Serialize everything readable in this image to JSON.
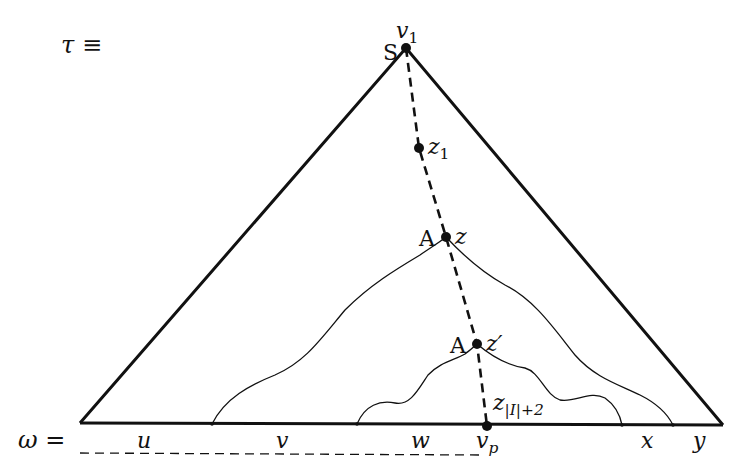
{
  "figure": {
    "tree_label": "τ ≡",
    "word_label": "ω =",
    "colors": {
      "stroke": "#111111",
      "background": "#ffffff"
    }
  },
  "nodes": {
    "v1": {
      "label": "v",
      "sub": "1",
      "mark": "S"
    },
    "z1": {
      "label": "z",
      "sub": "1"
    },
    "z": {
      "label": "z",
      "mark": "A"
    },
    "zprime": {
      "label": "z′",
      "mark": "A"
    },
    "z_last": {
      "label": "z",
      "sub": "|I|+2"
    },
    "vp": {
      "label": "v",
      "sub": "p"
    }
  },
  "segments": {
    "u": "u",
    "v": "v",
    "w": "w",
    "x": "x",
    "y": "y"
  },
  "geometry": {
    "apex": [
      406,
      48
    ],
    "base_left": [
      80,
      423
    ],
    "base_right": [
      723,
      425
    ],
    "spine_points": [
      [
        406,
        48
      ],
      [
        419,
        148
      ],
      [
        446,
        237
      ],
      [
        477,
        344
      ],
      [
        487,
        426
      ]
    ],
    "dashed_underline": [
      [
        80,
        453
      ],
      [
        480,
        455
      ]
    ]
  }
}
